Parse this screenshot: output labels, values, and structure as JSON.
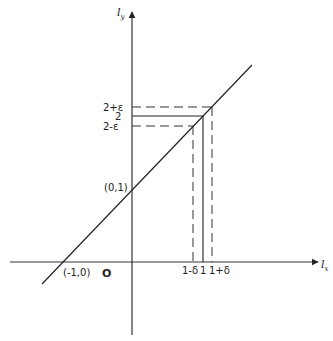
{
  "figure": {
    "type": "function-graph-diagram",
    "x_axis_label": {
      "main": "l",
      "sub": "x"
    },
    "y_axis_label": {
      "main": "l",
      "sub": "y"
    },
    "origin_label": "O",
    "line": {
      "equation": "y = x + 1",
      "passes_through": [
        [
          -1,
          0
        ],
        [
          0,
          1
        ],
        [
          1,
          2
        ]
      ]
    },
    "point_labels": {
      "x_intercept": "(-1,0)",
      "y_intercept": "(0,1)"
    },
    "x_ticks": [
      {
        "label": "1-δ",
        "value": "1-δ",
        "style": "dashed"
      },
      {
        "label": "1",
        "value": "1",
        "style": "solid"
      },
      {
        "label": "1+δ",
        "value": "1+δ",
        "style": "dashed"
      }
    ],
    "y_ticks": [
      {
        "label": "2+ε",
        "value": "2+ε",
        "style": "dashed"
      },
      {
        "label": "2",
        "value": "2",
        "style": "solid"
      },
      {
        "label": "2-ε",
        "value": "2-ε",
        "style": "dashed"
      }
    ]
  }
}
